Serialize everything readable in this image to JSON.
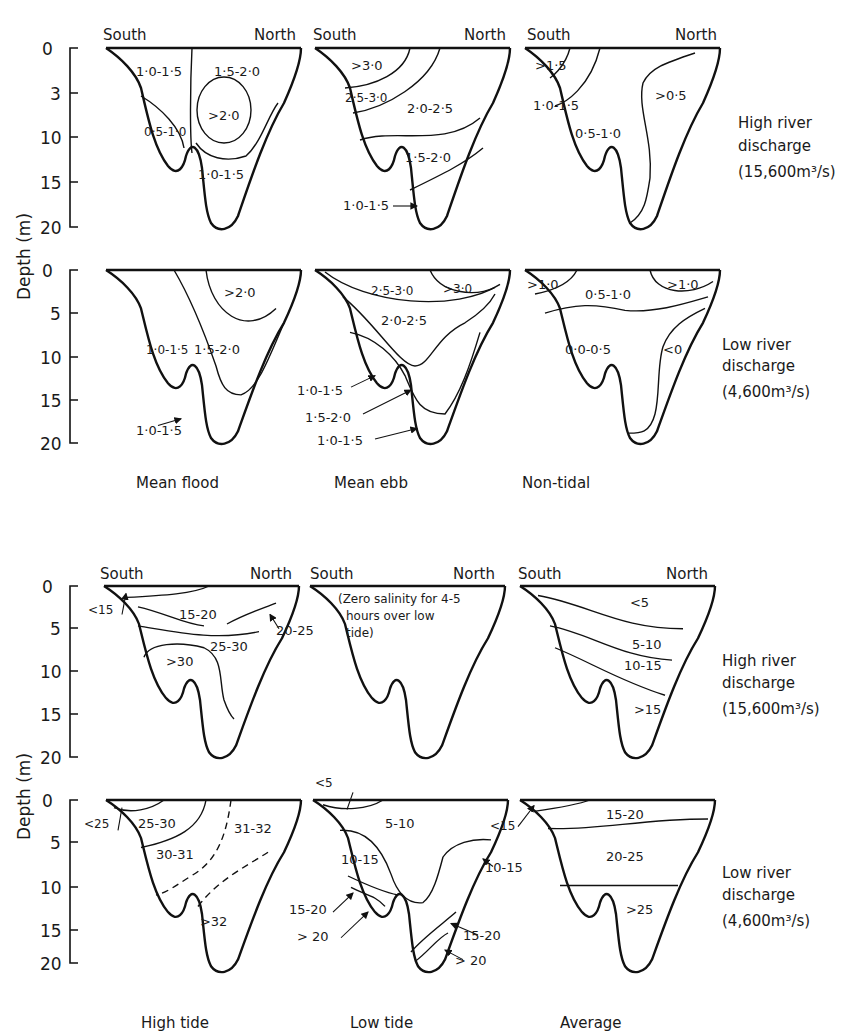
{
  "figure": {
    "upper_set": {
      "quantity": "velocity (m/s)",
      "column_titles": [
        "Mean flood",
        "Mean ebb",
        "Non-tidal"
      ],
      "rows": [
        {
          "condition_line1": "High river",
          "condition_line2": "discharge",
          "condition_line3": "(15,600m³/s)",
          "axis_ticks": [
            "0",
            "3",
            "10",
            "15",
            "20"
          ],
          "panels": [
            {
              "title": "Mean flood",
              "zones": [
                "1·0-1·5",
                "1·5-2·0",
                ">2·0",
                "0·5-1·0",
                "1·0-1·5"
              ]
            },
            {
              "title": "Mean ebb",
              "zones": [
                ">3·0",
                "2·5-3·0",
                "2·0-2·5",
                "1·5-2·0",
                "1·0-1·5"
              ]
            },
            {
              "title": "Non-tidal",
              "zones": [
                ">1·5",
                "1·0-1·5",
                ">0·5",
                "0·5-1·0"
              ]
            }
          ]
        },
        {
          "condition_line1": "Low river",
          "condition_line2": "discharge",
          "condition_line3": "(4,600m³/s)",
          "axis_ticks": [
            "0",
            "5",
            "10",
            "15",
            "20"
          ],
          "panels": [
            {
              "title": "Mean flood",
              "zones": [
                ">2·0",
                "1·0-1·5",
                "1·5-2·0",
                "1·0-1·5"
              ]
            },
            {
              "title": "Mean ebb",
              "zones": [
                "2·5-3·0",
                ">3·0",
                "2·0-2·5",
                "1·0-1·5",
                "1·5-2·0",
                "1·0-1·5"
              ]
            },
            {
              "title": "Non-tidal",
              "zones": [
                ">1·0",
                "0·5-1·0",
                ">1·0",
                "0·0-0·5",
                "<0"
              ]
            }
          ]
        }
      ]
    },
    "lower_set": {
      "quantity": "salinity",
      "column_titles": [
        "High tide",
        "Low tide",
        "Average"
      ],
      "rows": [
        {
          "condition_line1": "High river",
          "condition_line2": "discharge",
          "condition_line3": "(15,600m³/s)",
          "axis_ticks": [
            "0",
            "5",
            "10",
            "15",
            "20"
          ],
          "panels": [
            {
              "title": "High tide",
              "zones": [
                "<15",
                "15-20",
                "20-25",
                "25-30",
                ">30"
              ]
            },
            {
              "title": "Low tide",
              "note_line1": "(Zero salinity for 4-5",
              "note_line2": "hours over low",
              "note_line3": "tide)"
            },
            {
              "title": "Average",
              "zones": [
                "<5",
                "5-10",
                "10-15",
                ">15"
              ]
            }
          ]
        },
        {
          "condition_line1": "Low river",
          "condition_line2": "discharge",
          "condition_line3": "(4,600m³/s)",
          "axis_ticks": [
            "0",
            "5",
            "10",
            "15",
            "20"
          ],
          "panels": [
            {
              "title": "High tide",
              "zones": [
                "<25",
                "25-30",
                "30-31",
                "31-32",
                ">32"
              ]
            },
            {
              "title": "Low tide",
              "zones": [
                "<5",
                "5-10",
                "10-15",
                "10-15",
                "15-20",
                "> 20",
                "15-20",
                "> 20"
              ]
            },
            {
              "title": "Average",
              "zones": [
                "<15",
                "15-20",
                "20-25",
                ">25"
              ]
            }
          ]
        }
      ]
    },
    "labels": {
      "south": "South",
      "north": "North",
      "depth_axis": "Depth (m)"
    }
  }
}
